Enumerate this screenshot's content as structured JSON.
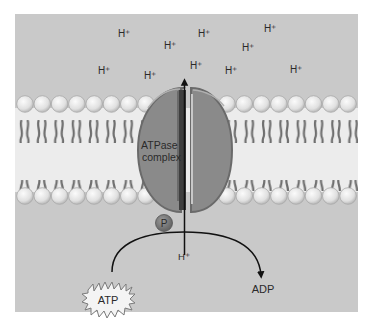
{
  "diagram": {
    "colors": {
      "panel_bg": "#c9c9c9",
      "membrane_core": "#e9e9e9",
      "lipid_head": "#e6e6e6",
      "lipid_tail": "#6f6f6f",
      "protein": "#8a8a8a",
      "protein_edge": "#6a6a6a",
      "channel": "#3a3a3a",
      "phosphate": "#7a7a7a",
      "arrow": "#111111"
    },
    "protons_above": [
      {
        "label": "H⁺",
        "x": 118,
        "y": 37
      },
      {
        "label": "H⁺",
        "x": 198,
        "y": 37
      },
      {
        "label": "H⁺",
        "x": 264,
        "y": 32
      },
      {
        "label": "H⁺",
        "x": 164,
        "y": 49
      },
      {
        "label": "H⁺",
        "x": 242,
        "y": 51
      },
      {
        "label": "H⁺",
        "x": 98,
        "y": 74
      },
      {
        "label": "H⁺",
        "x": 144,
        "y": 79
      },
      {
        "label": "H⁺",
        "x": 190,
        "y": 69
      },
      {
        "label": "H⁺",
        "x": 225,
        "y": 74
      },
      {
        "label": "H⁺",
        "x": 290,
        "y": 73
      }
    ],
    "protein_label_line1": "ATPase",
    "protein_label_line2": "complex",
    "phosphate_label": "P",
    "proton_below": "H⁺",
    "atp_label": "ATP",
    "adp_label": "ADP"
  }
}
